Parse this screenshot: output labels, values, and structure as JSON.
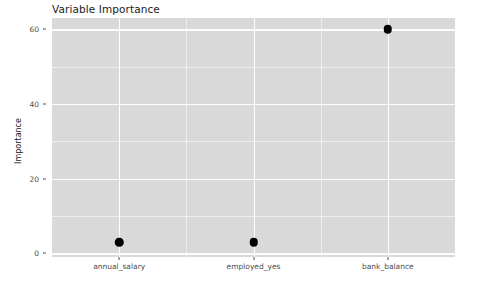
{
  "chart_data": {
    "type": "scatter",
    "title": "Variable Importance",
    "xlabel": "",
    "ylabel": "Importance",
    "categories": [
      "annual_salary",
      "employed_yes",
      "bank_balance"
    ],
    "values": [
      3,
      3,
      60
    ],
    "points": [
      {
        "category": "annual_salary",
        "value": 3
      },
      {
        "category": "employed_yes",
        "value": 3
      },
      {
        "category": "bank_balance",
        "value": 60
      }
    ],
    "ylim": [
      -1,
      63
    ],
    "y_ticks": [
      0,
      20,
      40,
      60
    ],
    "y_tick_labels": [
      "0",
      "20",
      "40",
      "60"
    ],
    "y_minor_ticks": [
      10,
      30,
      50
    ],
    "grid": true,
    "legend": "none",
    "panel_background": "#d9d9d9",
    "gridline_color": "#ffffff",
    "point_color": "#000000"
  },
  "axis": {
    "y_title": "Importance",
    "x_title": ""
  }
}
